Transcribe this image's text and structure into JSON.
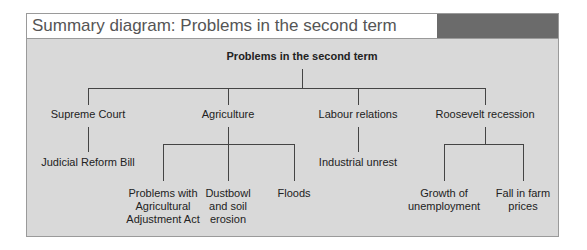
{
  "title": "Summary diagram: Problems in the second term",
  "colors": {
    "panel": "#d9d9d9",
    "header_block": "#6b6b6b",
    "border": "#9a9a9a",
    "line": "#444444"
  },
  "root": "Problems in the second term",
  "branches": [
    {
      "label": "Supreme Court",
      "children": [
        "Judicial Reform Bill"
      ]
    },
    {
      "label": "Agriculture",
      "children": [
        "Problems with\nAgricultural\nAdjustment Act",
        "Dustbowl\nand soil\nerosion",
        "Floods"
      ]
    },
    {
      "label": "Labour relations",
      "children": [
        "Industrial unrest"
      ]
    },
    {
      "label": "Roosevelt recession",
      "children": [
        "Growth of\nunemployment",
        "Fall in farm\nprices"
      ]
    }
  ]
}
